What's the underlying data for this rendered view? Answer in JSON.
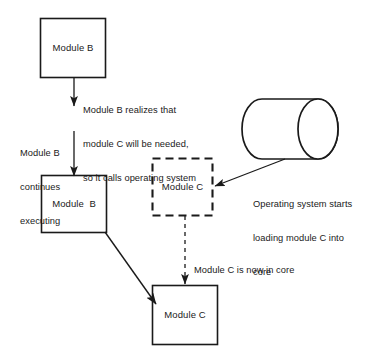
{
  "diagram": {
    "colors": {
      "stroke": "#1a1a1a",
      "background": "#ffffff",
      "text": "#1a1a1a"
    },
    "nodes": [
      {
        "id": "module-b-top",
        "label": "Module B",
        "shape": "rectangle",
        "border": "solid",
        "x": 40,
        "y": 18,
        "width": 66,
        "height": 60
      },
      {
        "id": "module-b-bottom",
        "label": "Module  B",
        "shape": "rectangle",
        "border": "solid",
        "x": 41,
        "y": 175,
        "width": 66,
        "height": 58
      },
      {
        "id": "module-c-dashed",
        "label": "Module C",
        "shape": "rectangle",
        "border": "dashed",
        "x": 152,
        "y": 158,
        "width": 61,
        "height": 58
      },
      {
        "id": "module-c-solid",
        "label": "Module C",
        "shape": "rectangle",
        "border": "solid",
        "x": 152,
        "y": 285,
        "width": 66,
        "height": 60
      },
      {
        "id": "disk-storage",
        "label": "",
        "shape": "cylinder-horizontal",
        "border": "solid",
        "x": 243,
        "y": 98,
        "width": 100,
        "height": 62
      }
    ],
    "edges": [
      {
        "id": "edge-call-os",
        "from": "module-b-top",
        "to": "operating-system",
        "style": "solid",
        "arrow": "end"
      },
      {
        "id": "edge-continue-executing",
        "from": "operating-system",
        "to": "module-b-bottom",
        "style": "solid",
        "arrow": "end"
      },
      {
        "id": "edge-os-loads-module-c",
        "from": "disk-storage",
        "to": "module-c-dashed",
        "style": "solid",
        "arrow": "end"
      },
      {
        "id": "edge-module-c-in-core",
        "from": "module-c-dashed",
        "to": "module-c-solid",
        "style": "dashed",
        "arrow": "end"
      },
      {
        "id": "edge-module-b-calls-module-c",
        "from": "module-b-bottom",
        "to": "module-c-solid",
        "style": "solid",
        "arrow": "end"
      }
    ],
    "annotations": [
      {
        "id": "annotation-call-os",
        "lines": [
          "Module B realizes that",
          "module C will be needed,",
          "so it calls operating system"
        ],
        "x": 83,
        "y": 82
      },
      {
        "id": "annotation-continues-executing",
        "lines": [
          "Module B",
          "continues",
          "executing"
        ],
        "x": 20,
        "y": 125
      },
      {
        "id": "annotation-os-loading",
        "lines": [
          "Operating system starts",
          "loading module C into",
          "core"
        ],
        "x": 253,
        "y": 176
      },
      {
        "id": "annotation-module-c-in-core",
        "lines": [
          "Module C is now in core"
        ],
        "x": 194,
        "y": 242
      }
    ]
  }
}
